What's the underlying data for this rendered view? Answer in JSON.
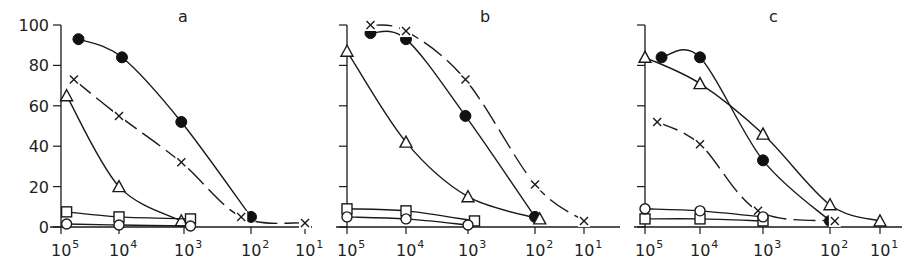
{
  "chart_data": [
    {
      "type": "line",
      "panel": "a",
      "title": "a",
      "xlabel": "",
      "ylabel": "",
      "xscale": "log",
      "x_reversed": true,
      "xticks": [
        "10^5",
        "10^4",
        "10^3",
        "10^2",
        "10^1"
      ],
      "yticks": [
        0,
        20,
        40,
        60,
        80,
        100
      ],
      "ylim": [
        0,
        100
      ],
      "series": [
        {
          "name": "filled-circle",
          "marker": "circle-filled",
          "line": "solid",
          "points": [
            [
              50000,
              93
            ],
            [
              9000,
              84
            ],
            [
              1100,
              52
            ],
            [
              100,
              5
            ]
          ]
        },
        {
          "name": "cross",
          "marker": "x",
          "line": "dashed",
          "points": [
            [
              60000,
              73
            ],
            [
              10000,
              55
            ],
            [
              1100,
              32
            ],
            [
              140,
              5
            ],
            [
              10,
              2
            ]
          ]
        },
        {
          "name": "open-triangle",
          "marker": "triangle-open",
          "line": "solid",
          "points": [
            [
              80000,
              65
            ],
            [
              10000,
              20
            ],
            [
              1100,
              3
            ]
          ]
        },
        {
          "name": "open-square",
          "marker": "square-open",
          "line": "solid",
          "points": [
            [
              80000,
              7.5
            ],
            [
              10000,
              5
            ],
            [
              800,
              4
            ]
          ]
        },
        {
          "name": "open-circle",
          "marker": "circle-open",
          "line": "solid",
          "points": [
            [
              80000,
              1.5
            ],
            [
              10000,
              1
            ],
            [
              800,
              0.5
            ]
          ]
        }
      ]
    },
    {
      "type": "line",
      "panel": "b",
      "title": "b",
      "xlabel": "",
      "ylabel": "",
      "xscale": "log",
      "x_reversed": true,
      "xticks": [
        "10^5",
        "10^4",
        "10^3",
        "10^2",
        "10^1"
      ],
      "yticks": [
        0,
        20,
        40,
        60,
        80,
        100
      ],
      "ylim": [
        0,
        100
      ],
      "series": [
        {
          "name": "filled-circle",
          "marker": "circle-filled",
          "line": "solid",
          "points": [
            [
              40000,
              96
            ],
            [
              10000,
              93
            ],
            [
              1100,
              55
            ],
            [
              100,
              5
            ]
          ]
        },
        {
          "name": "cross",
          "marker": "x",
          "line": "dashed",
          "points": [
            [
              40000,
              100
            ],
            [
              10000,
              97
            ],
            [
              1100,
              73
            ],
            [
              100,
              21
            ],
            [
              10,
              3
            ]
          ]
        },
        {
          "name": "open-triangle",
          "marker": "triangle-open",
          "line": "solid",
          "points": [
            [
              100000,
              87
            ],
            [
              10000,
              42
            ],
            [
              1000,
              15
            ],
            [
              80,
              4
            ]
          ]
        },
        {
          "name": "open-square",
          "marker": "square-open",
          "line": "solid",
          "points": [
            [
              100000,
              9
            ],
            [
              10000,
              8
            ],
            [
              800,
              3
            ]
          ]
        },
        {
          "name": "open-circle",
          "marker": "circle-open",
          "line": "solid",
          "points": [
            [
              100000,
              5
            ],
            [
              10000,
              4
            ],
            [
              1000,
              1
            ]
          ]
        }
      ]
    },
    {
      "type": "line",
      "panel": "c",
      "title": "c",
      "xlabel": "",
      "ylabel": "",
      "xscale": "log",
      "x_reversed": true,
      "xticks": [
        "10^5",
        "10^4",
        "10^3",
        "10^2",
        "10^1"
      ],
      "yticks": [
        0,
        20,
        40,
        60,
        80,
        100
      ],
      "ylim": [
        0,
        100
      ],
      "series": [
        {
          "name": "filled-circle",
          "marker": "circle-filled",
          "line": "solid",
          "points": [
            [
              50000,
              84
            ],
            [
              10000,
              84
            ],
            [
              1000,
              33
            ],
            [
              100,
              3
            ]
          ]
        },
        {
          "name": "cross",
          "marker": "x",
          "line": "dashed",
          "points": [
            [
              60000,
              52
            ],
            [
              10000,
              41
            ],
            [
              1200,
              8
            ],
            [
              80,
              3
            ]
          ]
        },
        {
          "name": "open-triangle",
          "marker": "triangle-open",
          "line": "solid",
          "points": [
            [
              100000,
              84
            ],
            [
              10000,
              71
            ],
            [
              1000,
              46
            ],
            [
              100,
              11
            ],
            [
              10,
              3
            ]
          ]
        },
        {
          "name": "open-square",
          "marker": "square-open",
          "line": "solid",
          "points": [
            [
              100000,
              4
            ],
            [
              10000,
              4
            ],
            [
              1000,
              3
            ]
          ]
        },
        {
          "name": "open-circle",
          "marker": "circle-open",
          "line": "solid",
          "points": [
            [
              100000,
              9
            ],
            [
              10000,
              8
            ],
            [
              1000,
              5
            ]
          ]
        }
      ]
    }
  ],
  "labels": {
    "y_tick_labels": [
      "0",
      "20",
      "40",
      "60",
      "80",
      "100"
    ],
    "x_tick_base": "10",
    "x_tick_exponents": [
      "5",
      "4",
      "3",
      "2",
      "1"
    ],
    "panel_a": "a",
    "panel_b": "b",
    "panel_c": "c"
  }
}
